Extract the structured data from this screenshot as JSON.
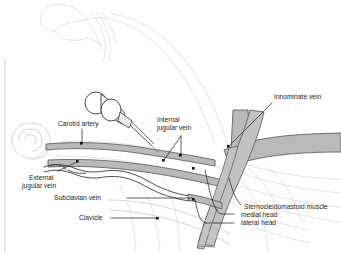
{
  "figure": {
    "type": "medical-line-illustration",
    "background_color": "#ffffff",
    "vessel_fill_color": "#b3b3b3",
    "vessel_stroke_color": "#4d4d4d",
    "muscle_fill_color": "#bfbfbf",
    "body_outline_color": "#d9d9d9",
    "leader_line_color": "#1a1a1a",
    "text_color": "#1a1a1a"
  },
  "labels": {
    "carotid_artery": "Carotid artery",
    "internal_jugular_vein_line1": "Internal",
    "internal_jugular_vein_line2": "jugular vein",
    "innominate_vein": "Innominate vein",
    "external_jugular_vein_line1": "External",
    "external_jugular_vein_line2": "jugular vein",
    "subclavian_vein": "Subclavian vein",
    "clavicle": "Clavicle",
    "sternocleidomastoid_muscle": "Sternocleidomastoid muscle",
    "medial_head": "medial head",
    "lateral_head": "lateral head"
  },
  "structures": [
    {
      "name": "carotid-artery",
      "label": "Carotid artery"
    },
    {
      "name": "internal-jugular-vein",
      "label": "Internal jugular vein"
    },
    {
      "name": "innominate-vein",
      "label": "Innominate vein"
    },
    {
      "name": "external-jugular-vein",
      "label": "External jugular vein"
    },
    {
      "name": "subclavian-vein",
      "label": "Subclavian vein"
    },
    {
      "name": "clavicle",
      "label": "Clavicle"
    },
    {
      "name": "sternocleidomastoid-muscle",
      "label": "Sternocleidomastoid muscle"
    },
    {
      "name": "sternocleidomastoid-medial-head",
      "label": "medial head"
    },
    {
      "name": "sternocleidomastoid-lateral-head",
      "label": "lateral head"
    },
    {
      "name": "syringe-needle",
      "label": "Syringe with needle"
    },
    {
      "name": "patient-head-outline",
      "label": "Patient head and neck outline"
    },
    {
      "name": "patient-ear-outline",
      "label": "Ear"
    }
  ]
}
